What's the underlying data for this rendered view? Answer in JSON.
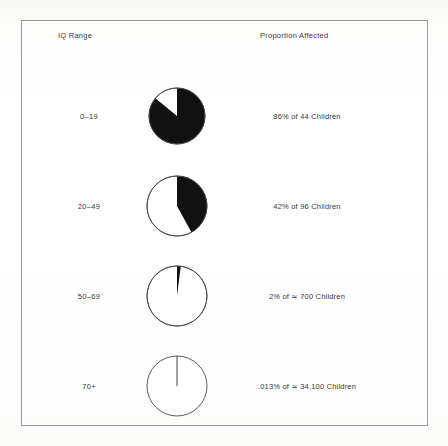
{
  "figure": {
    "columns": {
      "iq_range_header": "IQ Range",
      "proportion_header": "Proportion Affected"
    },
    "rows": [
      {
        "iq_range": "0–19",
        "proportion_text": "86% of 44 Children",
        "percent": 86
      },
      {
        "iq_range": "20–49",
        "proportion_text": "42% of 96 Children",
        "percent": 42
      },
      {
        "iq_range": "50–69",
        "proportion_text": "2% of ≃ 700 Children",
        "percent": 2
      },
      {
        "iq_range": "70+",
        "proportion_text": ".013% of ≃ 34,100 Children",
        "percent": 0.013
      }
    ],
    "colors": {
      "slice_filled": "#111111",
      "slice_empty": "#ffffff",
      "outline": "#4a4a4a",
      "frame": "#9a9a9a",
      "text": "#3a3a3a",
      "background": "#fdfdfd"
    }
  },
  "chart_data": {
    "type": "pie",
    "title": "",
    "subtitle": "",
    "xlabel": "IQ Range",
    "ylabel": "Proportion Affected",
    "legend": [],
    "grid": false,
    "series": [
      {
        "name": "Proportion Affected (%)",
        "categories": [
          "0–19",
          "20–49",
          "50–69",
          "70+"
        ],
        "values": [
          86,
          42,
          2,
          0.013
        ]
      }
    ],
    "population_totals": [
      44,
      96,
      700,
      34100
    ],
    "population_labels": [
      "44 Children",
      "96 Children",
      "≃ 700 Children",
      "≃ 34,100 Children"
    ],
    "data_labels": [
      "86% of 44 Children",
      "42% of 96 Children",
      "2% of ≃ 700 Children",
      ".013% of ≃ 34,100 Children"
    ],
    "slice_start_angle_deg": 0,
    "slice_direction": "clockwise"
  }
}
